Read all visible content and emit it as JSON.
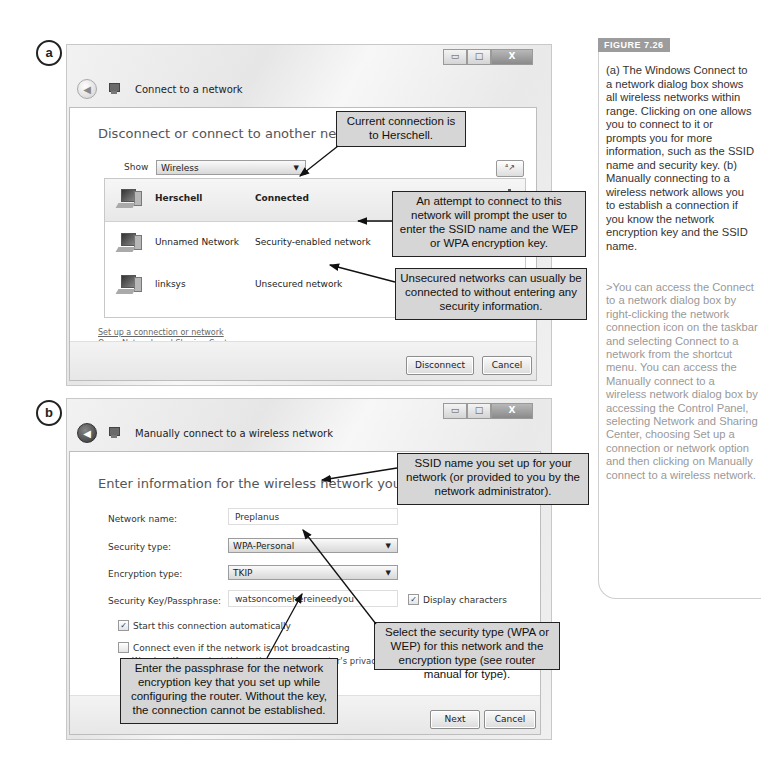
{
  "panel_a": {
    "label": "a",
    "window_controls": {
      "minimize": "▭",
      "maximize": "□",
      "close": "X"
    },
    "title": "Connect to a network",
    "heading": "Disconnect or connect to another network",
    "show_label": "Show",
    "show_value": "Wireless",
    "refresh_icon": "⁴↗",
    "networks": [
      {
        "name": "Herschell",
        "status": "Connected",
        "selected": true
      },
      {
        "name": "Unnamed Network",
        "status": "Security-enabled network",
        "selected": false
      },
      {
        "name": "linksys",
        "status": "Unsecured network",
        "selected": false
      }
    ],
    "links": [
      "Set up a connection or network",
      "Open Network and Sharing Center"
    ],
    "buttons": {
      "disconnect": "Disconnect",
      "cancel": "Cancel"
    },
    "callouts": {
      "current": "Current connection is to Herschell.",
      "secured": "An attempt to connect to this network will prompt the user to enter the SSID name and the WEP or WPA encryption key.",
      "unsecured": "Unsecured networks can usually be connected to without entering any security information."
    }
  },
  "panel_b": {
    "label": "b",
    "window_controls": {
      "minimize": "▭",
      "maximize": "□",
      "close": "X"
    },
    "title": "Manually connect to a wireless network",
    "heading": "Enter information for the wireless network you want to add",
    "fields": {
      "network_name": {
        "label": "Network name:",
        "value": "Preplanus"
      },
      "security_type": {
        "label": "Security type:",
        "value": "WPA-Personal"
      },
      "encryption_type": {
        "label": "Encryption type:",
        "value": "TKIP"
      },
      "security_key": {
        "label": "Security Key/Passphrase:",
        "value": "watsoncomehereineedyou"
      }
    },
    "display_characters": {
      "label": "Display characters",
      "checked": true
    },
    "start_auto": {
      "label": "Start this connection automatically",
      "checked": true
    },
    "connect_not_broadcasting": {
      "label": "Connect even if the network is not broadcasting",
      "checked": false
    },
    "warning": "Warning: If you select this option, your computer's privacy m",
    "buttons": {
      "next": "Next",
      "cancel": "Cancel"
    },
    "callouts": {
      "ssid": "SSID name you set up for your network (or provided to you by the network administrator).",
      "security": "Select the security type (WPA or WEP) for this network and the encryption type (see router manual for type).",
      "passphrase": "Enter the passphrase for the network encryption key that you set up while configuring the router. Without the key, the connection cannot be established."
    }
  },
  "sidebar": {
    "figure_tag": "FIGURE 7.26",
    "caption": "(a) The Windows Connect to a network dialog box shows all wireless networks within range. Clicking on one allows you to connect to it or prompts you for more information, such as the SSID name and security key. (b) Manually connecting to a wireless network allows you to establish a connection if you know the network encryption key and the SSID name.",
    "note": ">You can access the Connect to a network dialog box by right-clicking the network connection icon on the taskbar and selecting Connect to a network from the shortcut menu. You can access the Manually connect to a wireless network dialog box by accessing the Control Panel, selecting Network and Sharing Center, choosing Set up a connection or network option and then clicking on Manually connect to a wireless network."
  }
}
